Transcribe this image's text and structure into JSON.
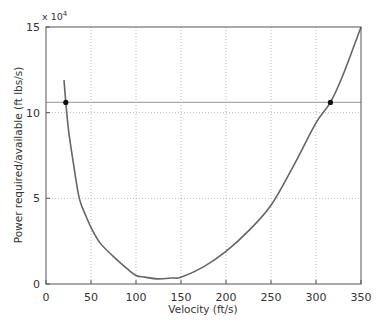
{
  "chart_data": {
    "type": "line",
    "title": "",
    "xlabel": "Velocity (ft/s)",
    "ylabel": "Power required/available (ft lbs/s)",
    "y_multiplier": "x 10^4",
    "y_multiplier_base": "x 10",
    "y_multiplier_exp": "4",
    "xlim": [
      0,
      350
    ],
    "ylim": [
      0,
      15
    ],
    "xticks": [
      0,
      50,
      100,
      150,
      200,
      250,
      300,
      350
    ],
    "yticks": [
      0,
      5,
      10,
      15
    ],
    "grid": true,
    "legend": null,
    "series": [
      {
        "name": "Power required",
        "color": "#666666",
        "x": [
          20,
          22,
          25,
          30,
          37,
          45,
          50,
          60,
          75,
          90,
          100,
          110,
          124,
          140,
          150,
          175,
          200,
          225,
          250,
          275,
          300,
          316,
          330,
          350
        ],
        "y": [
          11.9,
          10.6,
          9.0,
          7.2,
          5.0,
          3.9,
          3.3,
          2.4,
          1.6,
          0.9,
          0.5,
          0.4,
          0.3,
          0.35,
          0.4,
          1.0,
          1.9,
          3.1,
          4.6,
          6.9,
          9.4,
          10.6,
          12.2,
          15.0
        ]
      },
      {
        "name": "Power available",
        "color": "#aaaaaa",
        "x": [
          0,
          350
        ],
        "y": [
          10.6,
          10.6
        ]
      }
    ],
    "annotations": [
      {
        "type": "point",
        "x": 22,
        "y": 10.6,
        "label": "low-speed intersection"
      },
      {
        "type": "point",
        "x": 316,
        "y": 10.6,
        "label": "high-speed intersection"
      }
    ]
  }
}
